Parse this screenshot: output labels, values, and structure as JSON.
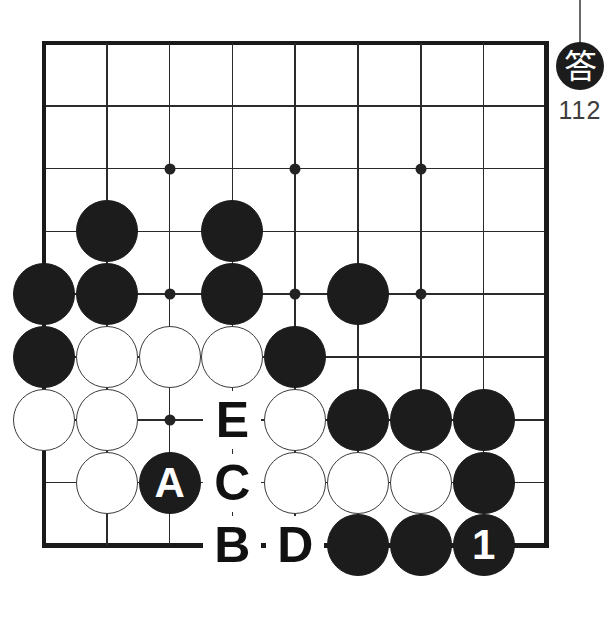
{
  "page": {
    "background": "#ffffff"
  },
  "answer_badge": {
    "icon_char": "答",
    "number": "112",
    "badge_color": "#1c1c1c",
    "number_color": "#3d3d3d"
  },
  "board": {
    "columns": 9,
    "rows": 9,
    "origin_x": 44,
    "origin_y": 43,
    "step": 62.8,
    "line_color": "#2b2b2b",
    "edge_color": "#1a1a1a",
    "black_color": "#1c1c1c",
    "white_color": "#ffffff",
    "edges": {
      "top": true,
      "left": true,
      "bottom": true,
      "right": true
    },
    "star_points": [
      {
        "col": 2,
        "row": 2
      },
      {
        "col": 4,
        "row": 2
      },
      {
        "col": 6,
        "row": 2
      },
      {
        "col": 2,
        "row": 4
      },
      {
        "col": 4,
        "row": 4
      },
      {
        "col": 6,
        "row": 4
      },
      {
        "col": 2,
        "row": 6
      }
    ],
    "stones": [
      {
        "col": 1,
        "row": 3,
        "color": "black",
        "label": ""
      },
      {
        "col": 3,
        "row": 3,
        "color": "black",
        "label": ""
      },
      {
        "col": 0,
        "row": 4,
        "color": "black",
        "label": ""
      },
      {
        "col": 1,
        "row": 4,
        "color": "black",
        "label": ""
      },
      {
        "col": 3,
        "row": 4,
        "color": "black",
        "label": ""
      },
      {
        "col": 5,
        "row": 4,
        "color": "black",
        "label": ""
      },
      {
        "col": 0,
        "row": 5,
        "color": "black",
        "label": ""
      },
      {
        "col": 1,
        "row": 5,
        "color": "white",
        "label": ""
      },
      {
        "col": 2,
        "row": 5,
        "color": "white",
        "label": ""
      },
      {
        "col": 3,
        "row": 5,
        "color": "white",
        "label": ""
      },
      {
        "col": 4,
        "row": 5,
        "color": "black",
        "label": ""
      },
      {
        "col": 0,
        "row": 6,
        "color": "white",
        "label": ""
      },
      {
        "col": 1,
        "row": 6,
        "color": "white",
        "label": ""
      },
      {
        "col": 4,
        "row": 6,
        "color": "white",
        "label": ""
      },
      {
        "col": 5,
        "row": 6,
        "color": "black",
        "label": ""
      },
      {
        "col": 6,
        "row": 6,
        "color": "black",
        "label": ""
      },
      {
        "col": 7,
        "row": 6,
        "color": "black",
        "label": ""
      },
      {
        "col": 1,
        "row": 7,
        "color": "white",
        "label": ""
      },
      {
        "col": 2,
        "row": 7,
        "color": "black",
        "label": "A"
      },
      {
        "col": 4,
        "row": 7,
        "color": "white",
        "label": ""
      },
      {
        "col": 5,
        "row": 7,
        "color": "white",
        "label": ""
      },
      {
        "col": 6,
        "row": 7,
        "color": "white",
        "label": ""
      },
      {
        "col": 7,
        "row": 7,
        "color": "black",
        "label": ""
      },
      {
        "col": 5,
        "row": 8,
        "color": "black",
        "label": ""
      },
      {
        "col": 6,
        "row": 8,
        "color": "black",
        "label": ""
      },
      {
        "col": 7,
        "row": 8,
        "color": "black",
        "label": "1"
      }
    ],
    "markers": [
      {
        "col": 3,
        "row": 6,
        "label": "E"
      },
      {
        "col": 3,
        "row": 7,
        "label": "C"
      },
      {
        "col": 3,
        "row": 8,
        "label": "B"
      },
      {
        "col": 4,
        "row": 8,
        "label": "D"
      }
    ]
  }
}
